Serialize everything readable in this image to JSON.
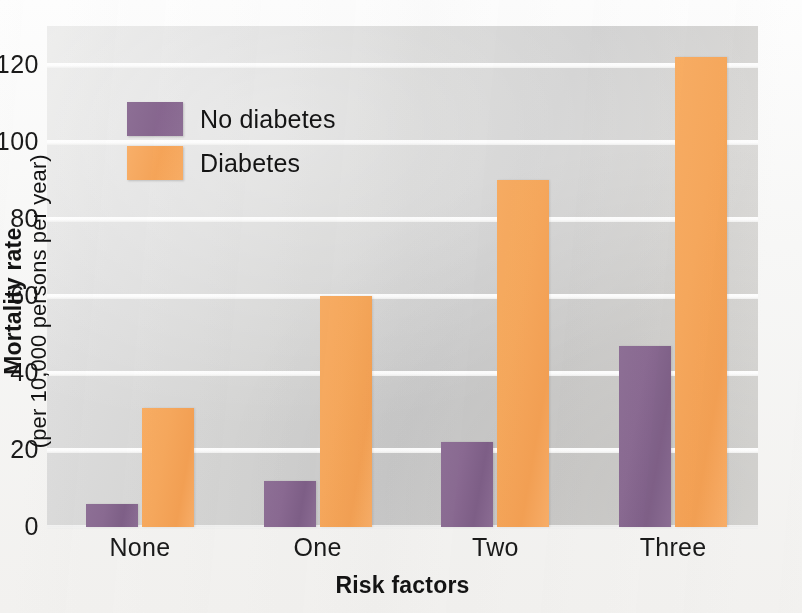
{
  "chart_data": {
    "type": "bar",
    "title": "",
    "subtitle": "",
    "xlabel": "Risk factors",
    "ylabel_line1": "Mortality rate",
    "ylabel_line2": "(per 10,000 persons per year)",
    "categories": [
      "None",
      "One",
      "Two",
      "Three"
    ],
    "series": [
      {
        "name": "No diabetes",
        "color": "#8a6a92",
        "values": [
          6,
          12,
          22,
          47
        ]
      },
      {
        "name": "Diabetes",
        "color": "#f6a85c",
        "values": [
          31,
          60,
          90,
          122
        ]
      }
    ],
    "yticks": [
      0,
      20,
      40,
      60,
      80,
      100,
      120
    ],
    "ytick_labels": [
      "0",
      "20",
      "40",
      "60",
      "80",
      "100",
      "120"
    ],
    "ylim": [
      0,
      130
    ],
    "grid": true,
    "legend_position": "upper-left-inside",
    "background_color": "#d6d6d5"
  },
  "legend": {
    "entries": [
      {
        "label": "No diabetes",
        "swatch": "purple-swatch"
      },
      {
        "label": "Diabetes",
        "swatch": "orange-swatch"
      }
    ]
  }
}
